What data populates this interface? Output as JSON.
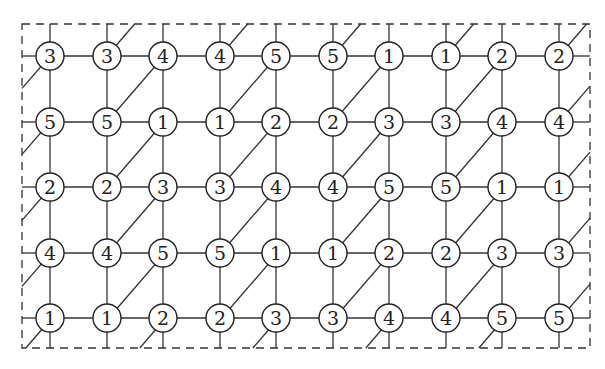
{
  "diagram": {
    "type": "toroidal grid graph with diagonal edges",
    "rows": 5,
    "cols": 10,
    "grid_labels": [
      [
        3,
        3,
        4,
        4,
        5,
        5,
        1,
        1,
        2,
        2
      ],
      [
        5,
        5,
        1,
        1,
        2,
        2,
        3,
        3,
        4,
        4
      ],
      [
        2,
        2,
        3,
        3,
        4,
        4,
        5,
        5,
        1,
        1
      ],
      [
        4,
        4,
        5,
        5,
        1,
        1,
        2,
        2,
        3,
        3
      ],
      [
        1,
        1,
        2,
        2,
        3,
        3,
        4,
        4,
        5,
        5
      ]
    ],
    "col_x": [
      50,
      107,
      163,
      220,
      276,
      333,
      389,
      446,
      502,
      559
    ],
    "row_y": [
      56,
      122,
      187,
      253,
      318
    ],
    "node_radius": 14,
    "border": {
      "x1": 22,
      "y1": 24,
      "x2": 590,
      "y2": 348,
      "style": "dashed"
    },
    "diagonal_source_cols": [
      1,
      3,
      5,
      7,
      9
    ],
    "colors": {
      "stroke": "#222222",
      "background": "#ffffff"
    }
  }
}
